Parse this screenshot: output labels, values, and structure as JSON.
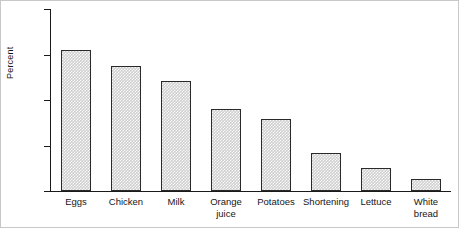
{
  "chart_data": {
    "type": "bar",
    "title": "",
    "xlabel": "",
    "ylabel": "Percent",
    "ylim": [
      0,
      80
    ],
    "yticks": [
      0,
      20,
      40,
      60,
      80
    ],
    "ytick_labels": [
      "0",
      "20",
      "40",
      "60",
      "80"
    ],
    "grid": false,
    "legend": null,
    "categories": [
      "Eggs",
      "Chicken",
      "Milk",
      "Orange\njuice",
      "Potatoes",
      "Shortening",
      "Lettuce",
      "White\nbread"
    ],
    "values": [
      61.8,
      54.8,
      48.5,
      36.2,
      31.5,
      16.8,
      10.2,
      5.5
    ],
    "bar_fill_color": "#cfcfcf",
    "bar_edge_color": "#2a2a2a",
    "axis_color": "#1a1a1a",
    "background_color": "#ffffff"
  }
}
